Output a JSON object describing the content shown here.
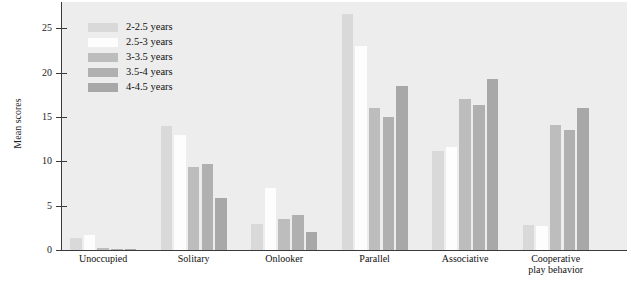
{
  "chart_data": {
    "type": "bar",
    "title": "",
    "xlabel": "",
    "ylabel": "Mean scores",
    "ylim": [
      0,
      28
    ],
    "yticks": [
      0,
      5,
      10,
      15,
      20,
      25
    ],
    "grid": false,
    "legend_position": "top-left-inside",
    "categories": [
      "Unoccupied",
      "Solitary",
      "Onlooker",
      "Parallel",
      "Associative",
      "Cooperative\nplay behavior"
    ],
    "series": [
      {
        "name": "2-2.5 years",
        "color": "#d9d9d9",
        "values": [
          1.3,
          14.0,
          2.9,
          26.6,
          11.2,
          2.8
        ]
      },
      {
        "name": "2.5-3 years",
        "color": "#fdfdfd",
        "values": [
          1.7,
          13.0,
          7.0,
          23.0,
          11.6,
          2.7
        ]
      },
      {
        "name": "3-3.5 years",
        "color": "#bdbdbd",
        "values": [
          0.2,
          9.4,
          3.5,
          16.0,
          17.0,
          14.1
        ]
      },
      {
        "name": "3.5-4 years",
        "color": "#b0b0b0",
        "values": [
          0.15,
          9.7,
          4.0,
          15.0,
          16.4,
          13.5
        ]
      },
      {
        "name": "4-4.5 years",
        "color": "#a8a8a8",
        "values": [
          0.1,
          5.9,
          2.0,
          18.5,
          19.3,
          16.0
        ]
      }
    ]
  },
  "style": {
    "plot_background": "#ededed",
    "axis_color": "#3a3a3a",
    "text_color": "#101010"
  }
}
